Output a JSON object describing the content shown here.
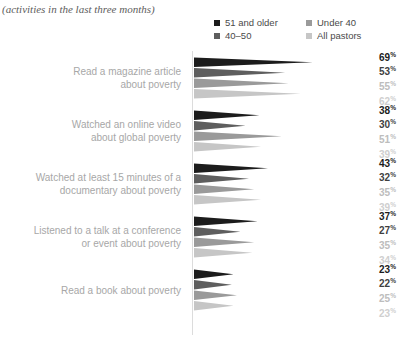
{
  "header": {
    "title": "",
    "subtitle": "(activities in the last three months)"
  },
  "legend": {
    "items": [
      {
        "label": "51 and older",
        "color": "#1c1c1c"
      },
      {
        "label": "Under 40",
        "color": "#9a9a9a"
      },
      {
        "label": "40–50",
        "color": "#5e5e5e"
      },
      {
        "label": "All pastors",
        "color": "#c6c6c6"
      }
    ]
  },
  "chart_data": {
    "type": "bar",
    "title": "",
    "subtitle": "(activities in the last three months)",
    "xlabel": "",
    "ylabel": "",
    "xlim": [
      0,
      100
    ],
    "grid": false,
    "legend_position": "top-right",
    "note": "Horizontal tapered-wedge chart; wedge length encodes percentage",
    "categories": [
      "Read a magazine article about poverty",
      "Watched an online video about global poverty",
      "Watched at least 15 minutes of a documentary about poverty",
      "Listened to a talk at a conference or event about poverty",
      "Read a book about poverty"
    ],
    "series": [
      {
        "name": "51 and older",
        "color": "#1c1c1c",
        "values": [
          69,
          38,
          43,
          37,
          23
        ]
      },
      {
        "name": "40–50",
        "color": "#5e5e5e",
        "values": [
          53,
          30,
          32,
          27,
          22
        ]
      },
      {
        "name": "Under 40",
        "color": "#9a9a9a",
        "values": [
          55,
          51,
          35,
          35,
          25
        ]
      },
      {
        "name": "All pastors",
        "color": "#c6c6c6",
        "values": [
          62,
          39,
          39,
          34,
          23
        ]
      }
    ]
  },
  "rows": [
    {
      "label_line1": "Read a magazine article",
      "label_line2": "about poverty",
      "values": [
        {
          "text": "69",
          "suffix": "%",
          "color": "#1c1c1c",
          "value": 69
        },
        {
          "text": "53",
          "suffix": "%",
          "color": "#3f3f3f",
          "value": 53
        },
        {
          "text": "55",
          "suffix": "%",
          "color": "#bdbdbd",
          "value": 55
        },
        {
          "text": "62",
          "suffix": "%",
          "color": "#cfcfcf",
          "value": 62
        }
      ]
    },
    {
      "label_line1": "Watched an online video",
      "label_line2": "about global poverty",
      "values": [
        {
          "text": "38",
          "suffix": "%",
          "color": "#1c1c1c",
          "value": 38
        },
        {
          "text": "30",
          "suffix": "%",
          "color": "#3f3f3f",
          "value": 30
        },
        {
          "text": "51",
          "suffix": "%",
          "color": "#bdbdbd",
          "value": 51
        },
        {
          "text": "39",
          "suffix": "%",
          "color": "#cfcfcf",
          "value": 39
        }
      ]
    },
    {
      "label_line1": "Watched at least 15 minutes of a",
      "label_line2": "documentary about poverty",
      "values": [
        {
          "text": "43",
          "suffix": "%",
          "color": "#1c1c1c",
          "value": 43
        },
        {
          "text": "32",
          "suffix": "%",
          "color": "#3f3f3f",
          "value": 32
        },
        {
          "text": "35",
          "suffix": "%",
          "color": "#bdbdbd",
          "value": 35
        },
        {
          "text": "39",
          "suffix": "%",
          "color": "#cfcfcf",
          "value": 39
        }
      ]
    },
    {
      "label_line1": "Listened to a talk at a conference",
      "label_line2": "or event about poverty",
      "values": [
        {
          "text": "37",
          "suffix": "%",
          "color": "#1c1c1c",
          "value": 37
        },
        {
          "text": "27",
          "suffix": "%",
          "color": "#3f3f3f",
          "value": 27
        },
        {
          "text": "35",
          "suffix": "%",
          "color": "#bdbdbd",
          "value": 35
        },
        {
          "text": "34",
          "suffix": "%",
          "color": "#cfcfcf",
          "value": 34
        }
      ]
    },
    {
      "label_line1": "Read a book about poverty",
      "label_line2": "",
      "values": [
        {
          "text": "23",
          "suffix": "%",
          "color": "#1c1c1c",
          "value": 23
        },
        {
          "text": "22",
          "suffix": "%",
          "color": "#3f3f3f",
          "value": 22
        },
        {
          "text": "25",
          "suffix": "%",
          "color": "#bdbdbd",
          "value": 25
        },
        {
          "text": "23",
          "suffix": "%",
          "color": "#cfcfcf",
          "value": 23
        }
      ]
    }
  ]
}
